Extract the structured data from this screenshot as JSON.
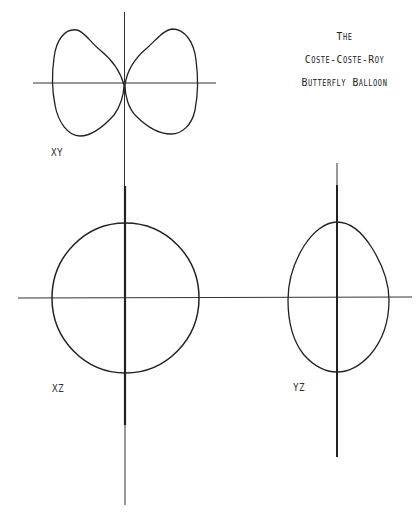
{
  "title": {
    "line1": "The",
    "line2": "Coste-Coste-Roy",
    "line3": "Butterfly Balloon"
  },
  "views": [
    {
      "id": "xy",
      "label": "XY",
      "shape": "butterfly (two-lobed, touching at origin)"
    },
    {
      "id": "xz",
      "label": "XZ",
      "shape": "circle"
    },
    {
      "id": "yz",
      "label": "YZ",
      "shape": "egg / rounded oval"
    }
  ],
  "colors": {
    "stroke": "#222222",
    "axis": "#333333",
    "background": "#ffffff"
  }
}
